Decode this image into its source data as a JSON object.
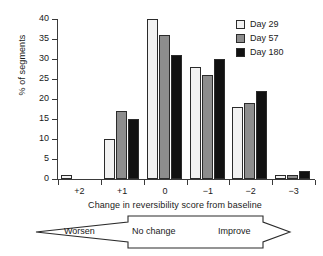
{
  "chart_data": {
    "type": "bar",
    "title": "",
    "xlabel": "Change in reversibility score from baseline",
    "ylabel": "% of segments",
    "categories": [
      "+2",
      "+1",
      "0",
      "−1",
      "−2",
      "−3"
    ],
    "ylim": [
      0,
      40
    ],
    "yticks": [
      0,
      5,
      10,
      15,
      20,
      25,
      30,
      35,
      40
    ],
    "grid": false,
    "legend_position": "top-right",
    "series": [
      {
        "name": "Day 29",
        "color": "#f2f2f2",
        "values": [
          1,
          10,
          40,
          28,
          18,
          1
        ]
      },
      {
        "name": "Day 57",
        "color": "#8d8d8d",
        "values": [
          0,
          17,
          36,
          26,
          19,
          1
        ]
      },
      {
        "name": "Day 180",
        "color": "#111111",
        "values": [
          0,
          15,
          31,
          30,
          22,
          2
        ]
      }
    ],
    "annotations": {
      "band_labels": [
        "Worsen",
        "No change",
        "Improve"
      ],
      "band_shape": "double-headed-arrow"
    }
  },
  "legend": {
    "entries": [
      {
        "label": "Day 29"
      },
      {
        "label": "Day 57"
      },
      {
        "label": "Day 180"
      }
    ]
  },
  "axes": {
    "y_label": "% of segments",
    "y_tick_labels": [
      "40",
      "35",
      "30",
      "25",
      "20",
      "15",
      "10",
      "5",
      "0"
    ],
    "x_tick_labels": [
      "+2",
      "+1",
      "0",
      "−1",
      "−2",
      "−3"
    ],
    "x_title": "Change in reversibility score from baseline"
  },
  "band": {
    "worsen": "Worsen",
    "no_change": "No change",
    "improve": "Improve"
  }
}
